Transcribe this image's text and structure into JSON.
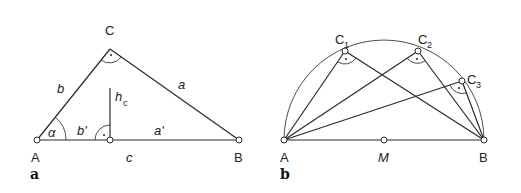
{
  "figure_a": {
    "panel_label": "a",
    "vertices": {
      "A": "A",
      "B": "B",
      "C": "C"
    },
    "sides": {
      "a": "a",
      "b": "b",
      "c": "c"
    },
    "segments": {
      "a_prime": "a'",
      "b_prime": "b'"
    },
    "altitude": {
      "h": "h",
      "sub": "c"
    },
    "angle": "α"
  },
  "figure_b": {
    "panel_label": "b",
    "vertices": {
      "A": "A",
      "B": "B",
      "M": "M"
    },
    "points": [
      {
        "name": "C",
        "sub": "1"
      },
      {
        "name": "C",
        "sub": "2"
      },
      {
        "name": "C",
        "sub": "3"
      }
    ]
  }
}
